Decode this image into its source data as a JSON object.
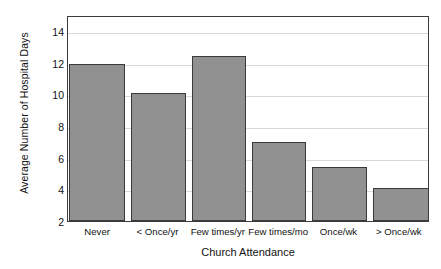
{
  "chart_data": {
    "type": "bar",
    "title": "",
    "xlabel": "Church Attendance",
    "ylabel": "Average Number of Hospital Days",
    "categories": [
      "Never",
      "< Once/yr",
      "Few times/yr",
      "Few times/mo",
      "Once/wk",
      "> Once/wk"
    ],
    "values": [
      11.9,
      10.1,
      12.4,
      7.0,
      5.4,
      4.1
    ],
    "ylim": [
      2,
      15
    ],
    "yticks": [
      2,
      4,
      6,
      8,
      10,
      12,
      14
    ],
    "ytick_labels": [
      "2",
      "4",
      "6",
      "8",
      "10",
      "12",
      "14"
    ],
    "grid": "horizontal",
    "legend": "none",
    "bar_color": "#919191",
    "bar_edge_color": "#3a3a3a",
    "grid_color": "#d9d9d9",
    "axis_color": "#3b3b3b",
    "background_color": "#ffffff"
  }
}
